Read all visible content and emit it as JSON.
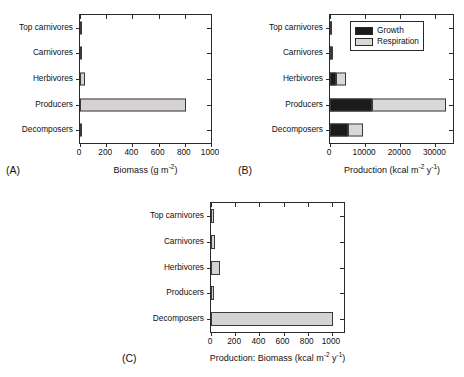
{
  "figure": {
    "background": "#ffffff",
    "categories": [
      "Top carnivores",
      "Carnivores",
      "Herbivores",
      "Producers",
      "Decomposers"
    ],
    "colors": {
      "growth": "#1b1b1b",
      "respiration": "#d8d8d8",
      "bar_fill": "#d6d2d4",
      "axis": "#2a2a2a"
    }
  },
  "chart_data": [
    {
      "type": "bar",
      "panel": "(A)",
      "orientation": "horizontal",
      "title": "",
      "xlabel_text": "Biomass (g m",
      "xlabel_sup": "-2",
      "xlabel_tail": ")",
      "ylabel": "",
      "categories": [
        "Top carnivores",
        "Carnivores",
        "Herbivores",
        "Producers",
        "Decomposers"
      ],
      "values": [
        4,
        11,
        37,
        809,
        5
      ],
      "xlim": [
        0,
        1000
      ],
      "xticks": [
        0,
        200,
        400,
        600,
        800,
        1000
      ],
      "xtick_labels": [
        "0",
        "200",
        "400",
        "600",
        "800",
        "1000"
      ],
      "grid": false,
      "legend": null
    },
    {
      "type": "bar",
      "panel": "(B)",
      "orientation": "horizontal",
      "stacked": true,
      "title": "",
      "xlabel_text": "Production (kcal m",
      "xlabel_sup": "-2",
      "xlabel_mid": " y",
      "xlabel_sup2": "-1",
      "xlabel_tail": ")",
      "ylabel": "",
      "categories": [
        "Top carnivores",
        "Carnivores",
        "Herbivores",
        "Producers",
        "Decomposers"
      ],
      "series": [
        {
          "name": "Growth",
          "values": [
            90,
            380,
            1600,
            12000,
            5000
          ],
          "color": "#1b1b1b"
        },
        {
          "name": "Respiration",
          "values": [
            60,
            320,
            2900,
            21000,
            4500
          ],
          "color": "#d8d8d8"
        }
      ],
      "totals": [
        150,
        700,
        4500,
        33000,
        9500
      ],
      "xlim": [
        0,
        35000
      ],
      "xticks": [
        0,
        10000,
        20000,
        30000
      ],
      "xtick_labels": [
        "0",
        "10000",
        "20000",
        "30000"
      ],
      "grid": false,
      "legend": {
        "position": "top-center",
        "entries": [
          "Growth",
          "Respiration"
        ]
      }
    },
    {
      "type": "bar",
      "panel": "(C)",
      "orientation": "horizontal",
      "title": "",
      "xlabel_text": "Production: Biomass (kcal m",
      "xlabel_sup": "-2",
      "xlabel_mid": " y",
      "xlabel_sup2": "-1",
      "xlabel_tail": ")",
      "ylabel": "",
      "categories": [
        "Top carnivores",
        "Carnivores",
        "Herbivores",
        "Producers",
        "Decomposers"
      ],
      "values": [
        22,
        30,
        72,
        27,
        1005
      ],
      "xlim": [
        0,
        1100
      ],
      "xticks": [
        0,
        200,
        400,
        600,
        800,
        1000
      ],
      "xtick_labels": [
        "0",
        "200",
        "400",
        "600",
        "800",
        "1000"
      ],
      "grid": false,
      "legend": null
    }
  ]
}
